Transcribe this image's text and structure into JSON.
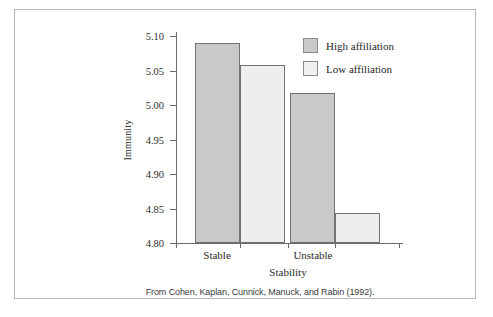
{
  "chart_data": {
    "type": "bar",
    "title": "",
    "xlabel": "Stability",
    "ylabel": "Immunity",
    "categories": [
      "Stable",
      "Unstable"
    ],
    "series": [
      {
        "name": "High affiliation",
        "values": [
          5.09,
          5.017
        ],
        "color": "#c9c9c9"
      },
      {
        "name": "Low affiliation",
        "values": [
          5.058,
          4.844
        ],
        "color": "#eeeeee"
      }
    ],
    "ylim": [
      4.8,
      5.1
    ],
    "ytick_labels": [
      "5.10",
      "5.05",
      "5.00",
      "4.95",
      "4.90",
      "4.85",
      "4.80"
    ],
    "ytick_values": [
      5.1,
      5.05,
      5.0,
      4.95,
      4.9,
      4.85,
      4.8
    ],
    "grid": false,
    "legend_position": "top-right"
  },
  "legend": {
    "entries": [
      {
        "label": "High affiliation",
        "swatch": "high"
      },
      {
        "label": "Low affiliation",
        "swatch": "low"
      }
    ]
  },
  "caption": {
    "text": "From Cohen, Kaplan, Cunnick, Manuck, and Rabin (1992)."
  },
  "colors": {
    "high_bar": "#c9c9c9",
    "low_bar": "#eeeeee",
    "bar_outline": "#727272",
    "axis": "#6a6a6a",
    "frame": "#b9b9b9",
    "text": "#2b2b2b",
    "background": "#ffffff"
  }
}
